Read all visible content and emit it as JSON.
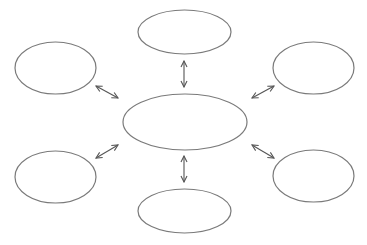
{
  "diagram": {
    "type": "hub-and-spoke concept map",
    "colors": {
      "outline": "#7a7a7a",
      "arrow": "#555555",
      "background": "#ffffff"
    },
    "center": {
      "id": "center",
      "label": "",
      "cx": 185,
      "cy": 122,
      "rx": 62,
      "ry": 28
    },
    "nodes": [
      {
        "id": "top",
        "label": "",
        "cx": 184.5,
        "cy": 32,
        "rx": 46.5,
        "ry": 22
      },
      {
        "id": "top-left",
        "label": "",
        "cx": 55.5,
        "cy": 68,
        "rx": 40.5,
        "ry": 26
      },
      {
        "id": "top-right",
        "label": "",
        "cx": 313.5,
        "cy": 68,
        "rx": 40.5,
        "ry": 26
      },
      {
        "id": "bottom-left",
        "label": "",
        "cx": 55.5,
        "cy": 177,
        "rx": 40.5,
        "ry": 26
      },
      {
        "id": "bottom-right",
        "label": "",
        "cx": 313.5,
        "cy": 176,
        "rx": 40.5,
        "ry": 26
      },
      {
        "id": "bottom",
        "label": "",
        "cx": 184.5,
        "cy": 211,
        "rx": 46.5,
        "ry": 22
      }
    ],
    "arrows": [
      {
        "from": "center",
        "to": "top",
        "x1": 184,
        "y1": 87,
        "x2": 184,
        "y2": 61,
        "bidirectional": true
      },
      {
        "from": "center",
        "to": "bottom",
        "x1": 184,
        "y1": 156,
        "x2": 184,
        "y2": 182,
        "bidirectional": true
      },
      {
        "from": "center",
        "to": "top-left",
        "x1": 118,
        "y1": 98,
        "x2": 96,
        "y2": 86,
        "bidirectional": true
      },
      {
        "from": "center",
        "to": "top-right",
        "x1": 252,
        "y1": 98,
        "x2": 274,
        "y2": 86,
        "bidirectional": true
      },
      {
        "from": "center",
        "to": "bottom-left",
        "x1": 118,
        "y1": 145,
        "x2": 96,
        "y2": 158,
        "bidirectional": true
      },
      {
        "from": "center",
        "to": "bottom-right",
        "x1": 252,
        "y1": 145,
        "x2": 274,
        "y2": 158,
        "bidirectional": true
      }
    ]
  }
}
